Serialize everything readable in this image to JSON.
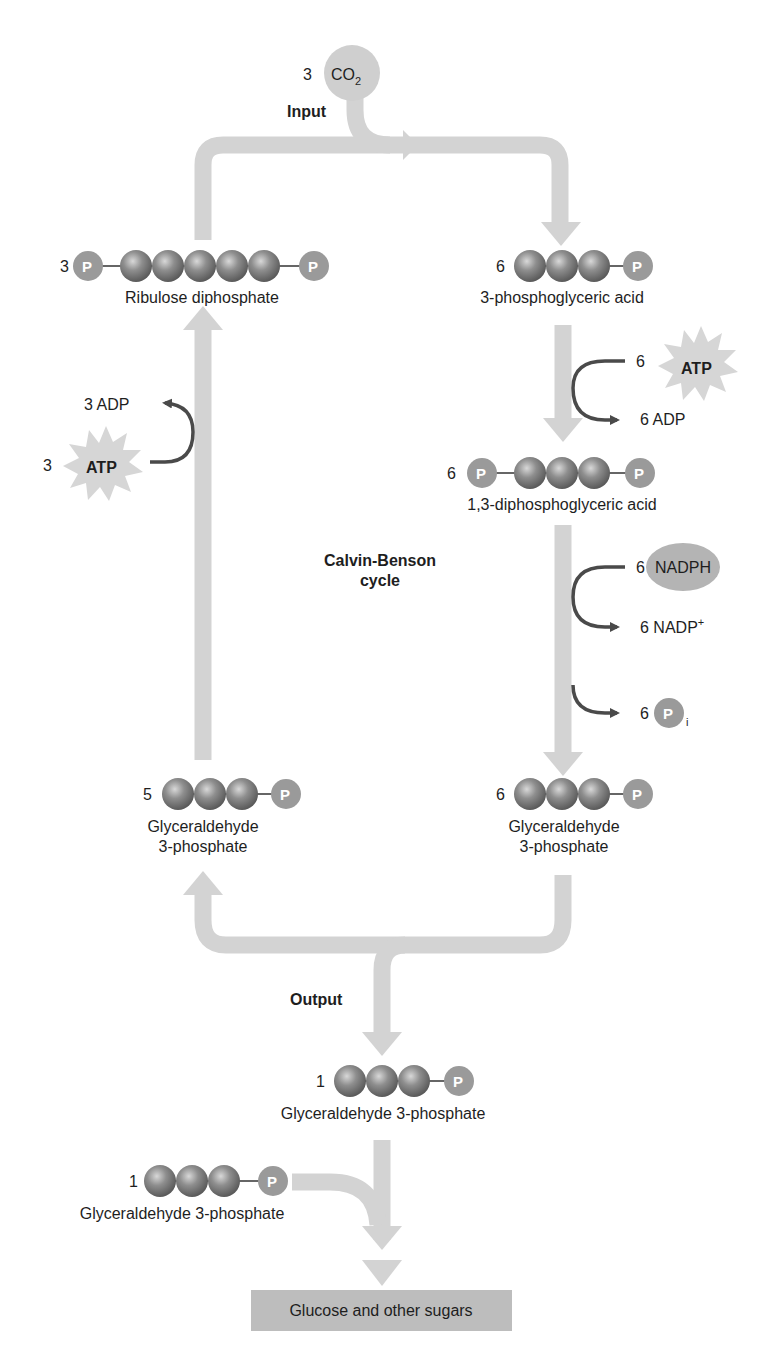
{
  "diagram": {
    "title": "Calvin-Benson cycle",
    "title_line1": "Calvin-Benson",
    "title_line2": "cycle",
    "colors": {
      "pipe": "#d3d3d3",
      "carbon_bead": "#8a8a8a",
      "phosphate": "#9a9a9a",
      "arrow_dark": "#4a4a4a",
      "starburst": "#d6d6d6",
      "nadph_ellipse": "#b4b4b4",
      "co2_circle": "#cfcfcf",
      "product_box": "#bdbdbd"
    },
    "input": {
      "label": "Input",
      "co2_count": "3",
      "co2_formula": "CO",
      "co2_subscript": "2"
    },
    "molecules": {
      "ribulose": {
        "count": "3",
        "name": "Ribulose diphosphate",
        "carbons": 5,
        "phosphates": "both ends"
      },
      "pga": {
        "count": "6",
        "name": "3-phosphoglyceric acid",
        "carbons": 3,
        "phosphates": "right"
      },
      "dpga": {
        "count": "6",
        "name": "1,3-diphosphoglyceric acid",
        "carbons": 3,
        "phosphates": "both ends"
      },
      "g3p_right": {
        "count": "6",
        "name_line1": "Glyceraldehyde",
        "name_line2": "3-phosphate",
        "carbons": 3
      },
      "g3p_left": {
        "count": "5",
        "name_line1": "Glyceraldehyde",
        "name_line2": "3-phosphate",
        "carbons": 3
      },
      "g3p_output": {
        "count": "1",
        "name": "Glyceraldehyde 3-phosphate",
        "carbons": 3
      },
      "g3p_second": {
        "count": "1",
        "name": "Glyceraldehyde 3-phosphate",
        "carbons": 3
      }
    },
    "phosphate_symbol": "P",
    "cofactors": {
      "atp_right": {
        "count": "6",
        "label": "ATP"
      },
      "adp_right": {
        "label": "6 ADP"
      },
      "nadph": {
        "count": "6",
        "label": "NADPH"
      },
      "nadp": {
        "label": "6 NADP",
        "superscript": "+"
      },
      "pi": {
        "count": "6",
        "symbol": "P",
        "subscript": "i"
      },
      "atp_left": {
        "count": "3",
        "label": "ATP"
      },
      "adp_left": {
        "label": "3 ADP"
      }
    },
    "output": {
      "label": "Output"
    },
    "product": {
      "label": "Glucose and other sugars"
    }
  }
}
